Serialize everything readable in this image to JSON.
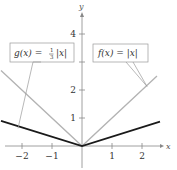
{
  "chart_data": {
    "type": "line",
    "title": "",
    "xlabel": "x",
    "ylabel": "y",
    "xlim": [
      -2.7,
      2.6
    ],
    "ylim": [
      0,
      4.8
    ],
    "x_ticks": [
      -2,
      -1,
      1,
      2
    ],
    "x_tick_labels": [
      "−2",
      "−1",
      "1",
      "2"
    ],
    "y_ticks": [
      1,
      2,
      3,
      4
    ],
    "y_tick_labels": [
      "1",
      "2",
      "",
      "4"
    ],
    "grid": false,
    "series": [
      {
        "name": "f(x) = |x|",
        "label_text": "f(x) = |x|",
        "color": "#b3b3b3",
        "x": [
          -2.7,
          0,
          2.5
        ],
        "values": [
          2.7,
          0,
          2.5
        ]
      },
      {
        "name": "g(x) = 1/3 |x|",
        "label_text": "g(x) = ⅓ |x|",
        "color": "#1a1a1a",
        "x": [
          -2.7,
          0,
          2.6
        ],
        "values": [
          0.9,
          0,
          0.867
        ]
      }
    ],
    "annotations": [
      {
        "text": "g(x) = 1/3 |x|",
        "points_to": [
          -2.1,
          0.7
        ]
      },
      {
        "text": "f(x) = |x|",
        "points_to": [
          2.2,
          2.2
        ]
      }
    ]
  },
  "labels": {
    "x_axis": "x",
    "y_axis": "y",
    "g_prefix": "g(x) = ",
    "g_num": "1",
    "g_den": "3",
    "g_suffix": "|x|",
    "f_text": "f(x) = |x|"
  },
  "colors": {
    "axis": "#888888",
    "f_line": "#b3b3b3",
    "g_line": "#1a1a1a",
    "callout_border": "#999999",
    "text": "#333333"
  }
}
